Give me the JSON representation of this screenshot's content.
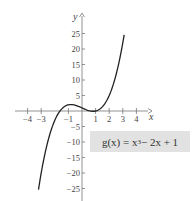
{
  "chart_data": {
    "type": "line",
    "title": "",
    "xlabel": "x",
    "ylabel": "y",
    "xlim": [
      -4.9,
      4.9
    ],
    "ylim": [
      -28,
      31
    ],
    "x_ticks": [
      -4,
      -3,
      -1,
      1,
      2,
      3,
      4
    ],
    "x_tick_labels": [
      "−4",
      "−3",
      "−1",
      "1",
      "2",
      "3",
      "4"
    ],
    "y_ticks": [
      25,
      20,
      15,
      10,
      5,
      -5,
      -10,
      -15,
      -20,
      -25
    ],
    "y_tick_labels": [
      "25",
      "20",
      "15",
      "10",
      "5",
      "−5",
      "−10",
      "−15",
      "−20",
      "−25"
    ],
    "grid": false,
    "legend": "none",
    "annotation": {
      "label_prefix": "g(x) = x",
      "label_exponent": "3",
      "label_suffix": " − 2x + 1",
      "box_color": "#e2e2e2"
    },
    "series": [
      {
        "name": "g(x) = x^3 - 2x + 1",
        "color": "#222222",
        "x": [
          -3.2,
          -3.0,
          -2.5,
          -2.0,
          -1.5,
          -1.0,
          -0.5,
          0.0,
          0.5,
          1.0,
          1.5,
          2.0,
          2.5,
          3.0,
          3.1
        ],
        "y": [
          -25.4,
          -20.0,
          -9.6,
          -3.0,
          0.625,
          2.0,
          1.875,
          1.0,
          0.125,
          0.0,
          1.375,
          5.0,
          11.6,
          22.0,
          24.6
        ]
      }
    ]
  },
  "mapping": {
    "origin_px": [
      82,
      111
    ],
    "x_scale": 13.6,
    "y_scale": 3.1
  }
}
